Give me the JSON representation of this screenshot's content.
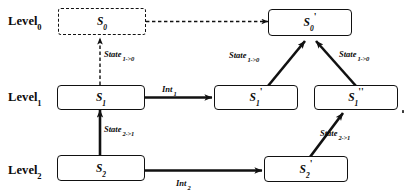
{
  "diagram": {
    "stroke_color": "#111111",
    "background_color": "#ffffff"
  },
  "levels": [
    {
      "name": "Level",
      "sub": "0"
    },
    {
      "name": "Level",
      "sub": "1"
    },
    {
      "name": "Level",
      "sub": "2"
    }
  ],
  "nodes": [
    {
      "id": "s0",
      "base": "S",
      "sub": "0",
      "prime": "",
      "style": "dashed"
    },
    {
      "id": "s0p",
      "base": "S",
      "sub": "0",
      "prime": "'",
      "style": "solid"
    },
    {
      "id": "s1",
      "base": "S",
      "sub": "1",
      "prime": "",
      "style": "solid"
    },
    {
      "id": "s1p",
      "base": "S",
      "sub": "1",
      "prime": "'",
      "style": "solid"
    },
    {
      "id": "s1pp",
      "base": "S",
      "sub": "1",
      "prime": "''",
      "style": "solid"
    },
    {
      "id": "s2",
      "base": "S",
      "sub": "2",
      "prime": "",
      "style": "solid"
    },
    {
      "id": "s2p",
      "base": "S",
      "sub": "2",
      "prime": "'",
      "style": "solid"
    }
  ],
  "edge_labels": [
    {
      "id": "state-1-0-left",
      "base": "State",
      "sub": "1->0"
    },
    {
      "id": "state-2-1-left",
      "base": "State",
      "sub": "2->1"
    },
    {
      "id": "state-1-0-middle",
      "base": "State",
      "sub": "1->0"
    },
    {
      "id": "state-1-0-right",
      "base": "State",
      "sub": "1->0"
    },
    {
      "id": "state-2-1-right",
      "base": "State",
      "sub": "2->1"
    },
    {
      "id": "int-1",
      "base": "Int",
      "sub": "1"
    },
    {
      "id": "int-2",
      "base": "Int",
      "sub": "2"
    }
  ]
}
